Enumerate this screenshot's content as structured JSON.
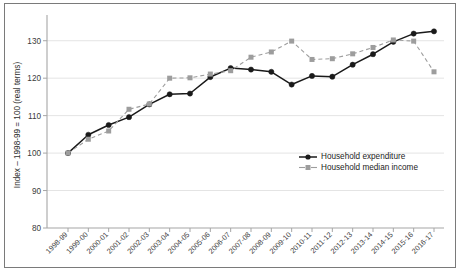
{
  "chart_data": {
    "type": "line",
    "title": "",
    "xlabel": "",
    "ylabel": "Index – 1998-99 = 100 (real terms)",
    "ylim": [
      80,
      135
    ],
    "yticks": [
      80,
      90,
      100,
      110,
      120,
      130
    ],
    "ytick_labels": [
      "80",
      "90",
      "100",
      "110",
      "120",
      "130"
    ],
    "grid": true,
    "legend_position": "center-right",
    "categories": [
      "1998-99",
      "1999-00",
      "2000-01",
      "2001-02",
      "2002-03",
      "2003-04",
      "2004-05",
      "2005-06",
      "2006-07",
      "2007-08",
      "2008-09",
      "2009-10",
      "2010-11",
      "2011-12",
      "2012-13",
      "2013-14",
      "2014-15",
      "2015-16",
      "2016-17"
    ],
    "series": [
      {
        "name": "Household expenditure",
        "marker": "circle",
        "linestyle": "solid",
        "color": "#1a1a1a",
        "values": [
          100.0,
          104.9,
          107.5,
          109.6,
          113.0,
          115.7,
          115.9,
          120.3,
          122.7,
          122.3,
          121.7,
          118.3,
          120.6,
          120.4,
          123.6,
          126.4,
          129.7,
          131.9,
          132.5
        ]
      },
      {
        "name": "Household median income",
        "marker": "square",
        "linestyle": "dashed",
        "color": "#9d9d9d",
        "values": [
          100.0,
          103.7,
          105.9,
          111.7,
          113.1,
          120.0,
          120.1,
          121.1,
          122.0,
          125.6,
          127.0,
          129.9,
          125.0,
          125.2,
          126.5,
          128.2,
          130.2,
          129.9,
          121.7
        ]
      }
    ]
  },
  "legend": {
    "items": [
      {
        "label": "Household expenditure"
      },
      {
        "label": "Household median income"
      }
    ]
  }
}
